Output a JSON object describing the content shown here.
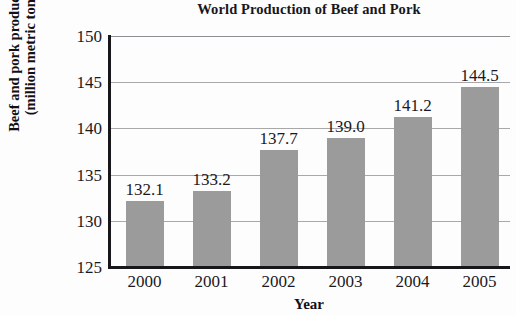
{
  "chart_data": {
    "type": "bar",
    "title": "World Production of Beef and Pork",
    "xlabel": "Year",
    "ylabel": "Beef and pork production (million metric tons)",
    "ylabel_lines": [
      "Beef and pork production",
      "(million metric tons)"
    ],
    "categories": [
      "2000",
      "2001",
      "2002",
      "2003",
      "2004",
      "2005"
    ],
    "values": [
      132.1,
      133.2,
      137.7,
      139.0,
      141.2,
      144.5
    ],
    "value_labels": [
      "132.1",
      "133.2",
      "137.7",
      "139.0",
      "141.2",
      "144.5"
    ],
    "ylim": [
      125,
      150
    ],
    "yticks": [
      150,
      145,
      140,
      135,
      130,
      125
    ],
    "ytick_labels": [
      "150",
      "145",
      "140",
      "135",
      "130",
      "125"
    ],
    "grid": true,
    "legend": null,
    "bar_color": "#9b9b9b",
    "axis_color": "#17161a",
    "grid_color": "#a8a8ab",
    "background": "#fdfdfd"
  }
}
